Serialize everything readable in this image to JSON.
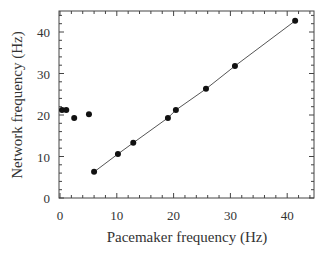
{
  "chart_data": {
    "type": "scatter",
    "title": "",
    "xlabel": "Pacemaker frequency  (Hz)",
    "ylabel": "Network frequency  (Hz)",
    "xlim": [
      0,
      45
    ],
    "ylim": [
      0,
      45
    ],
    "xticks": [
      0,
      10,
      20,
      30,
      40
    ],
    "yticks": [
      0,
      10,
      20,
      30,
      40
    ],
    "grid": false,
    "legend": null,
    "series": [
      {
        "name": "entrained (on fit line)",
        "marker": "filled-circle",
        "connected": true,
        "points": [
          [
            6.0,
            6.3
          ],
          [
            10.2,
            10.6
          ],
          [
            12.9,
            13.3
          ],
          [
            19.0,
            19.3
          ],
          [
            20.4,
            21.2
          ],
          [
            25.7,
            26.3
          ],
          [
            30.8,
            31.8
          ],
          [
            41.4,
            42.7
          ]
        ]
      },
      {
        "name": "not entrained (low pacemaker frequency)",
        "marker": "filled-circle",
        "connected": false,
        "points": [
          [
            0.35,
            21.2
          ],
          [
            1.1,
            21.2
          ],
          [
            2.5,
            19.3
          ],
          [
            5.1,
            20.2
          ]
        ]
      }
    ]
  },
  "axes": {
    "x_label": "Pacemaker frequency  (Hz)",
    "y_label": "Network frequency  (Hz)",
    "x_tick_labels": [
      "0",
      "10",
      "20",
      "30",
      "40"
    ],
    "y_tick_labels": [
      "0",
      "10",
      "20",
      "30",
      "40"
    ]
  },
  "colors": {
    "points": "#111111",
    "line": "#555555",
    "frame": "#444444"
  }
}
